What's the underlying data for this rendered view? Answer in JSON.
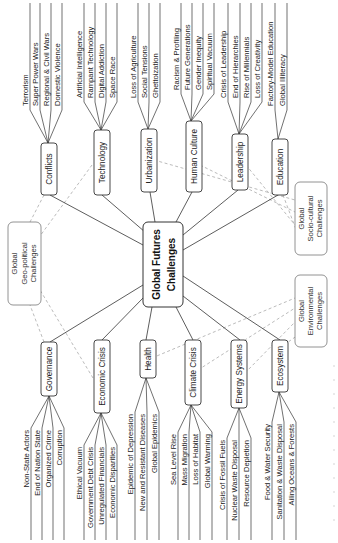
{
  "hub": {
    "line1": "Global Futures",
    "line2": "Challenges"
  },
  "groups": [
    {
      "id": "geo",
      "lines": [
        "Global",
        "Geo-political",
        "Challenges"
      ]
    },
    {
      "id": "socio",
      "lines": [
        "Global",
        "Socio-cultural",
        "Challenges"
      ]
    },
    {
      "id": "env",
      "lines": [
        "Global",
        "Environmental",
        "Challenges"
      ]
    }
  ],
  "top_branches": [
    {
      "label": "Conflicts",
      "group": "geo",
      "leaves": [
        "Terrorism",
        "Super Power Wars",
        "Regional & Civil Wars",
        "Domestic Violence"
      ]
    },
    {
      "label": "Technology",
      "group": "geo",
      "leaves": [
        "Artificial Intelligence",
        "Rampant Technology",
        "Digital Addiction",
        "Space Race"
      ]
    },
    {
      "label": "Urbanization",
      "group": "socio",
      "leaves": [
        "Loss of Agriculture",
        "Social Tensions",
        "Ghettoization"
      ]
    },
    {
      "label": "Human Culture",
      "group": "socio",
      "leaves": [
        "Racism & Profiling",
        "Future Generations",
        "Gender Inequity",
        "Spiritual Vacuum"
      ]
    },
    {
      "label": "Leadership",
      "group": "socio",
      "leaves": [
        "Crisis of Leadership",
        "End of Hierarchies",
        "Rise of Millennials",
        "Loss of Creativity"
      ]
    },
    {
      "label": "Education",
      "group": "socio",
      "leaves": [
        "Factory-Model Education",
        "Global Illiteracy"
      ]
    }
  ],
  "bottom_branches": [
    {
      "label": "Governance",
      "group": "geo",
      "leaves": [
        "Non-State Actors",
        "End of Nation State",
        "Organized Crime",
        "Corruption"
      ]
    },
    {
      "label": "Economic Crisis",
      "group": "geo",
      "leaves": [
        "Ethical Vacuum",
        "Government Debt Crisis",
        "Unregulated Financials",
        "Economic Disparities"
      ]
    },
    {
      "label": "Health",
      "group": "env",
      "leaves": [
        "Epidemic of Depression",
        "New and Resistant Diseases",
        "Global Epidemics"
      ]
    },
    {
      "label": "Climate Crisis",
      "group": "env",
      "leaves": [
        "Sea Level Rise",
        "Mass Migration",
        "Loss of Habitat",
        "Global Warming"
      ]
    },
    {
      "label": "Energy Systems",
      "group": "env",
      "leaves": [
        "Crisis of Fossil Fuels",
        "Nuclear Waste Disposal",
        "Resource Depletion"
      ]
    },
    {
      "label": "Ecosystem",
      "group": "env",
      "leaves": [
        "Food & Water Security",
        "Sanitation & Waste Disposal",
        "Ailing Oceans & Forests"
      ]
    }
  ],
  "colors": {
    "stroke": "#333333",
    "dashed": "#aaaaaa",
    "text": "#222222",
    "background": "#ffffff"
  }
}
